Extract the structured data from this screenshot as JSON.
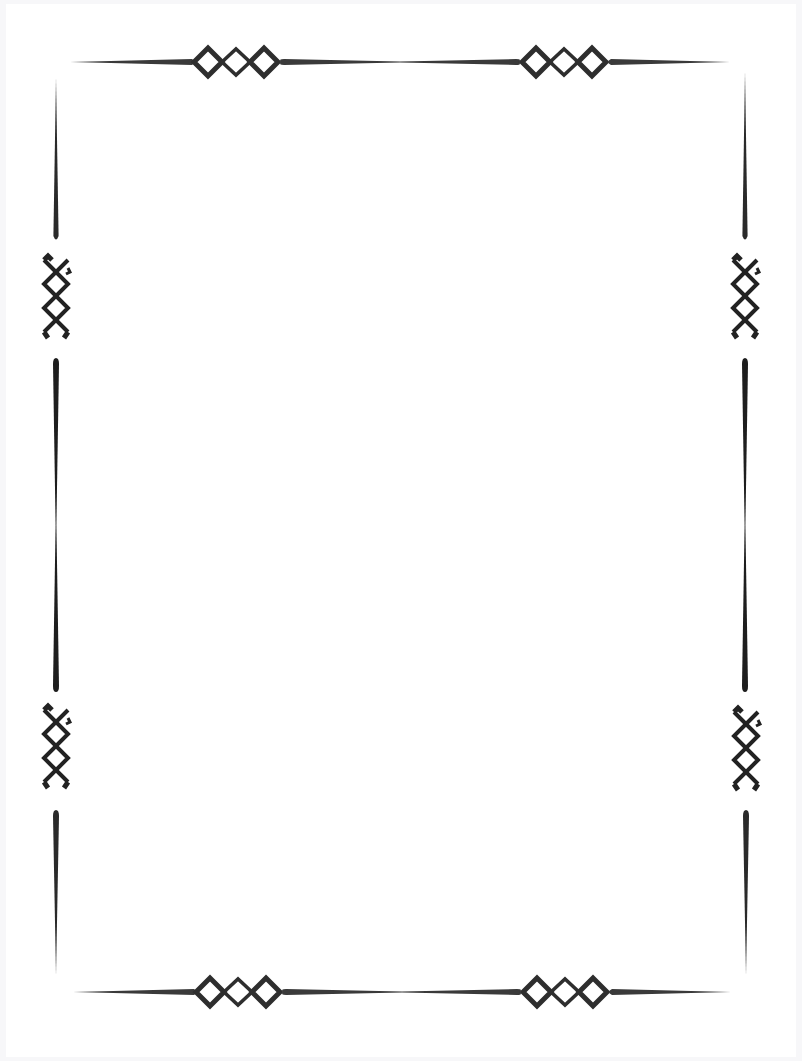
{
  "document": {
    "type": "decorative-page-border",
    "background": "#ffffff",
    "ink_color": "#333333",
    "text": ""
  },
  "border": {
    "top_y": 62,
    "bottom_y": 991,
    "left_x": 56,
    "right_x": 746,
    "ornaments": {
      "horizontal_diamond_chain_count": 4,
      "vertical_knot_count": 4,
      "diamonds_per_chain": 3
    }
  }
}
